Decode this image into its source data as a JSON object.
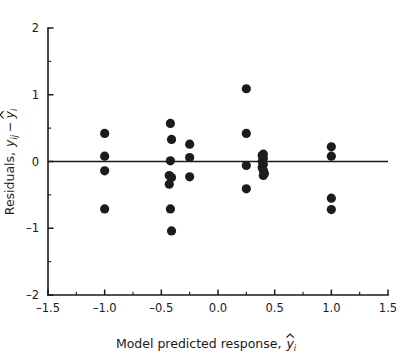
{
  "chart_data": {
    "type": "scatter",
    "title": "",
    "xlabel": "Model predicted response,",
    "xlabel_symbol": "y",
    "xlabel_symbol_sub": "i",
    "ylabel": "Residuals,",
    "ylabel_symbol_1": "y",
    "ylabel_symbol_1_sub": "ij",
    "ylabel_minus": "−",
    "ylabel_symbol_2": "y",
    "ylabel_symbol_2_sub": "i",
    "xlim": [
      -1.5,
      1.5
    ],
    "ylim": [
      -2,
      2
    ],
    "xticks": [
      -1.5,
      -1.0,
      -0.5,
      0.0,
      0.5,
      1.0,
      1.5
    ],
    "xticklabels": [
      "–1.5",
      "–1.0",
      "–0.5",
      "0.0",
      "0.5",
      "1.0",
      "1.5"
    ],
    "yticks": [
      -2,
      -1,
      0,
      1,
      2
    ],
    "yticklabels": [
      "–2",
      "–1",
      "0",
      "1",
      "2"
    ],
    "x_minor_ticks": [
      -1.25,
      -0.75,
      -0.25,
      0.25,
      0.75,
      1.25
    ],
    "y_minor_ticks": [
      -1.5,
      -0.5,
      0.5,
      1.5
    ],
    "grid": false,
    "legend": null,
    "reference_line_y": 0,
    "marker": "filled-circle",
    "marker_color": "#1c1c1c",
    "marker_size_px": 4.6,
    "points": [
      [
        -1.0,
        0.42
      ],
      [
        -1.0,
        0.08
      ],
      [
        -1.0,
        -0.14
      ],
      [
        -1.0,
        -0.71
      ],
      [
        -0.42,
        0.57
      ],
      [
        -0.41,
        0.33
      ],
      [
        -0.42,
        0.01
      ],
      [
        -0.43,
        -0.21
      ],
      [
        -0.41,
        -0.24
      ],
      [
        -0.43,
        -0.34
      ],
      [
        -0.42,
        -0.71
      ],
      [
        -0.41,
        -1.04
      ],
      [
        -0.25,
        0.26
      ],
      [
        -0.25,
        0.06
      ],
      [
        -0.25,
        -0.23
      ],
      [
        0.25,
        1.09
      ],
      [
        0.25,
        0.42
      ],
      [
        0.25,
        -0.06
      ],
      [
        0.25,
        -0.41
      ],
      [
        0.39,
        0.09
      ],
      [
        0.4,
        0.11
      ],
      [
        0.4,
        0.05
      ],
      [
        0.39,
        0.0
      ],
      [
        0.4,
        -0.04
      ],
      [
        0.39,
        -0.09
      ],
      [
        0.4,
        -0.13
      ],
      [
        0.41,
        -0.18
      ],
      [
        0.4,
        -0.21
      ],
      [
        1.0,
        0.22
      ],
      [
        1.0,
        0.08
      ],
      [
        1.0,
        -0.55
      ],
      [
        1.0,
        -0.72
      ]
    ]
  }
}
